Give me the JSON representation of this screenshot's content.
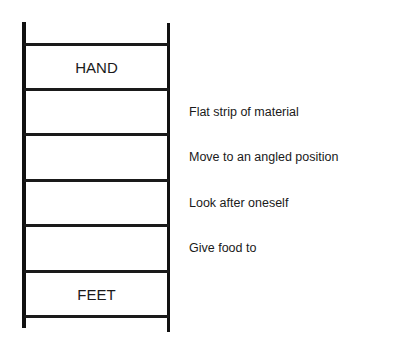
{
  "ladder": {
    "top_word": "HAND",
    "bottom_word": "FEET",
    "rung_count": 7
  },
  "clues": [
    {
      "label": "Flat strip of material"
    },
    {
      "label": "Move to an angled position"
    },
    {
      "label": "Look after oneself"
    },
    {
      "label": "Give food to"
    }
  ]
}
